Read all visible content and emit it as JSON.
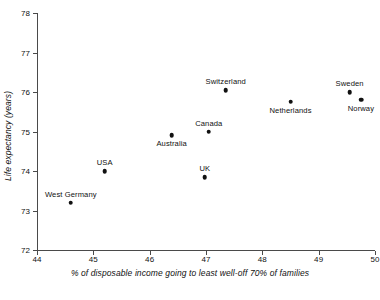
{
  "chart_data": {
    "type": "scatter",
    "title": "",
    "xlabel": "% of disposable income going to least well-off 70% of families",
    "ylabel": "Life expectancy (years)",
    "xlim": [
      44,
      50
    ],
    "ylim": [
      72,
      78
    ],
    "xticks": [
      "44",
      "45",
      "46",
      "47",
      "48",
      "49",
      "50"
    ],
    "yticks": [
      "72",
      "73",
      "74",
      "75",
      "76",
      "77",
      "78"
    ],
    "grid": false,
    "legend": "none",
    "marker_color": "#111111",
    "axis_color": "#4a4a4a",
    "points": [
      {
        "label": "West Germany",
        "x": 44.6,
        "y": 73.2,
        "label_pos": "above"
      },
      {
        "label": "USA",
        "x": 45.2,
        "y": 74.0,
        "label_pos": "above"
      },
      {
        "label": "Australia",
        "x": 46.39,
        "y": 74.9,
        "label_pos": "below"
      },
      {
        "label": "UK",
        "x": 46.98,
        "y": 73.85,
        "label_pos": "above"
      },
      {
        "label": "Canada",
        "x": 47.05,
        "y": 75.0,
        "label_pos": "above"
      },
      {
        "label": "Switzerland",
        "x": 47.35,
        "y": 76.05,
        "label_pos": "above"
      },
      {
        "label": "Netherlands",
        "x": 48.5,
        "y": 75.75,
        "label_pos": "below"
      },
      {
        "label": "Sweden",
        "x": 49.55,
        "y": 76.0,
        "label_pos": "above"
      },
      {
        "label": "Norway",
        "x": 49.75,
        "y": 75.8,
        "label_pos": "below"
      }
    ]
  }
}
